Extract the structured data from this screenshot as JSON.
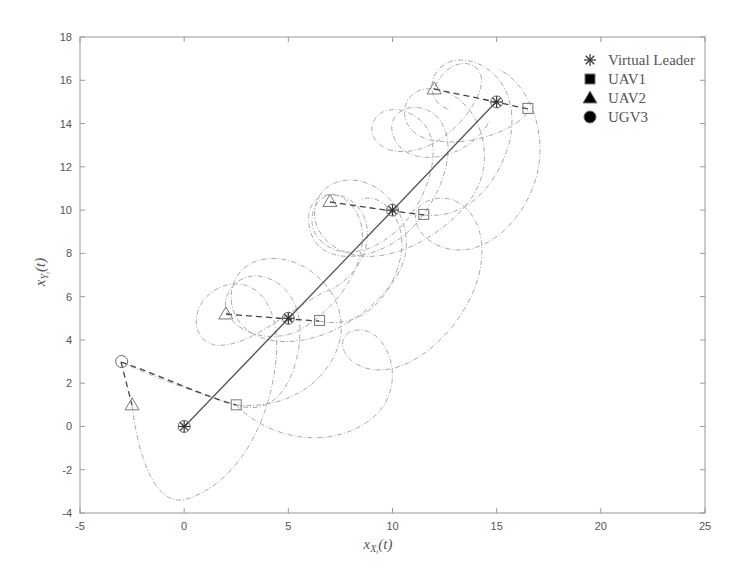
{
  "chart_data": {
    "type": "line",
    "title": "",
    "xlabel": "x_{X_i}(t)",
    "ylabel": "x_{Y_i}(t)",
    "xlim": [
      -5,
      25
    ],
    "ylim": [
      -4,
      18
    ],
    "xticks": [
      "-5",
      "0",
      "5",
      "10",
      "15",
      "20",
      "25"
    ],
    "yticks": [
      "-4",
      "-2",
      "0",
      "2",
      "4",
      "6",
      "8",
      "10",
      "12",
      "14",
      "16",
      "18"
    ],
    "grid": false,
    "legend_position": "upper right",
    "legend": [
      "Virtual Leader",
      "UAV1",
      "UAV2",
      "UGV3"
    ],
    "series": [
      {
        "name": "Virtual Leader",
        "marker": "asterisk",
        "style": "solid",
        "points": [
          [
            0,
            0
          ],
          [
            5,
            5
          ],
          [
            10,
            10
          ],
          [
            15,
            15
          ]
        ]
      },
      {
        "name": "UAV1",
        "marker": "square",
        "style": "dash-dot",
        "snapshots": [
          [
            2.5,
            1
          ],
          [
            6.5,
            4.9
          ],
          [
            11.5,
            9.8
          ],
          [
            16.5,
            14.7
          ]
        ]
      },
      {
        "name": "UAV2",
        "marker": "triangle",
        "style": "dash-dot",
        "snapshots": [
          [
            -2.5,
            1
          ],
          [
            2,
            5.2
          ],
          [
            7,
            10.4
          ],
          [
            12,
            15.6
          ]
        ]
      },
      {
        "name": "UGV3",
        "marker": "circle",
        "style": "dash-dot",
        "snapshots": [
          [
            -3,
            3
          ],
          [
            0,
            0
          ],
          [
            5,
            5
          ],
          [
            10,
            10
          ],
          [
            15,
            15
          ]
        ]
      }
    ]
  }
}
